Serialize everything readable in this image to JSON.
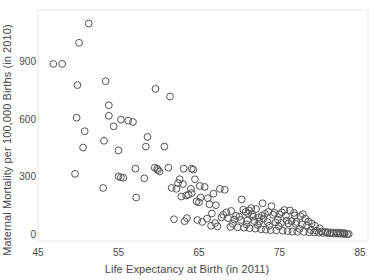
{
  "chart_data": {
    "type": "scatter",
    "title": "",
    "xlabel": "Life Expectancy at Birth (in 2011)",
    "ylabel": "Maternal Mortality per 100,000 Births (in 2010)",
    "xlim": [
      45,
      85
    ],
    "ylim": [
      -30,
      1120
    ],
    "xticks": [
      45,
      55,
      65,
      75,
      85
    ],
    "yticks": [
      0,
      300,
      600,
      900
    ],
    "xtick_labels": [
      "45",
      "55",
      "65",
      "75",
      "85"
    ],
    "ytick_labels": [
      "0",
      "300",
      "600",
      "900"
    ],
    "grid": false,
    "legend": null,
    "marker": {
      "shape": "circle-open",
      "edge_color": "#555555",
      "fill": "none",
      "radius_px": 3.4,
      "stroke_px": 1
    },
    "points": [
      {
        "x": 51.3,
        "y": 1100
      },
      {
        "x": 50.1,
        "y": 1000
      },
      {
        "x": 46.9,
        "y": 890
      },
      {
        "x": 48.0,
        "y": 890
      },
      {
        "x": 49.9,
        "y": 780
      },
      {
        "x": 53.4,
        "y": 800
      },
      {
        "x": 59.6,
        "y": 760
      },
      {
        "x": 61.4,
        "y": 720
      },
      {
        "x": 53.8,
        "y": 675
      },
      {
        "x": 49.8,
        "y": 610
      },
      {
        "x": 53.8,
        "y": 620
      },
      {
        "x": 55.3,
        "y": 600
      },
      {
        "x": 56.2,
        "y": 595
      },
      {
        "x": 56.8,
        "y": 588
      },
      {
        "x": 54.4,
        "y": 565
      },
      {
        "x": 50.8,
        "y": 540
      },
      {
        "x": 58.6,
        "y": 510
      },
      {
        "x": 53.2,
        "y": 490
      },
      {
        "x": 50.6,
        "y": 455
      },
      {
        "x": 58.4,
        "y": 460
      },
      {
        "x": 60.7,
        "y": 460
      },
      {
        "x": 55.0,
        "y": 440
      },
      {
        "x": 57.1,
        "y": 345
      },
      {
        "x": 59.5,
        "y": 350
      },
      {
        "x": 59.8,
        "y": 345
      },
      {
        "x": 59.9,
        "y": 338
      },
      {
        "x": 60.1,
        "y": 330
      },
      {
        "x": 61.2,
        "y": 350
      },
      {
        "x": 63.1,
        "y": 345
      },
      {
        "x": 64.1,
        "y": 345
      },
      {
        "x": 64.3,
        "y": 340
      },
      {
        "x": 49.6,
        "y": 318
      },
      {
        "x": 55.0,
        "y": 305
      },
      {
        "x": 55.3,
        "y": 300
      },
      {
        "x": 55.6,
        "y": 298
      },
      {
        "x": 58.2,
        "y": 295
      },
      {
        "x": 62.6,
        "y": 290
      },
      {
        "x": 64.5,
        "y": 290
      },
      {
        "x": 62.4,
        "y": 270
      },
      {
        "x": 63.0,
        "y": 265
      },
      {
        "x": 53.1,
        "y": 245
      },
      {
        "x": 61.6,
        "y": 245
      },
      {
        "x": 62.2,
        "y": 240
      },
      {
        "x": 64.0,
        "y": 240
      },
      {
        "x": 65.1,
        "y": 255
      },
      {
        "x": 65.7,
        "y": 250
      },
      {
        "x": 67.6,
        "y": 240
      },
      {
        "x": 68.2,
        "y": 235
      },
      {
        "x": 66.8,
        "y": 215
      },
      {
        "x": 64.1,
        "y": 218
      },
      {
        "x": 63.7,
        "y": 210
      },
      {
        "x": 63.4,
        "y": 205
      },
      {
        "x": 62.8,
        "y": 200
      },
      {
        "x": 65.2,
        "y": 195
      },
      {
        "x": 66.1,
        "y": 192
      },
      {
        "x": 64.7,
        "y": 175
      },
      {
        "x": 65.0,
        "y": 170
      },
      {
        "x": 70.3,
        "y": 185
      },
      {
        "x": 57.2,
        "y": 195
      },
      {
        "x": 66.3,
        "y": 160
      },
      {
        "x": 67.1,
        "y": 155
      },
      {
        "x": 72.9,
        "y": 165
      },
      {
        "x": 74.0,
        "y": 150
      },
      {
        "x": 71.5,
        "y": 140
      },
      {
        "x": 72.1,
        "y": 135
      },
      {
        "x": 75.6,
        "y": 130
      },
      {
        "x": 76.3,
        "y": 128
      },
      {
        "x": 69.0,
        "y": 125
      },
      {
        "x": 68.4,
        "y": 118
      },
      {
        "x": 70.8,
        "y": 120
      },
      {
        "x": 71.1,
        "y": 112
      },
      {
        "x": 71.6,
        "y": 108
      },
      {
        "x": 73.2,
        "y": 110
      },
      {
        "x": 74.2,
        "y": 105
      },
      {
        "x": 75.0,
        "y": 108
      },
      {
        "x": 75.8,
        "y": 100
      },
      {
        "x": 76.9,
        "y": 102
      },
      {
        "x": 77.6,
        "y": 98
      },
      {
        "x": 63.5,
        "y": 88
      },
      {
        "x": 66.0,
        "y": 85
      },
      {
        "x": 67.8,
        "y": 92
      },
      {
        "x": 68.6,
        "y": 88
      },
      {
        "x": 69.4,
        "y": 80
      },
      {
        "x": 70.2,
        "y": 78
      },
      {
        "x": 71.0,
        "y": 75
      },
      {
        "x": 71.9,
        "y": 72
      },
      {
        "x": 72.5,
        "y": 70
      },
      {
        "x": 73.5,
        "y": 68
      },
      {
        "x": 74.5,
        "y": 65
      },
      {
        "x": 75.2,
        "y": 62
      },
      {
        "x": 76.1,
        "y": 60
      },
      {
        "x": 77.0,
        "y": 58
      },
      {
        "x": 77.8,
        "y": 55
      },
      {
        "x": 78.4,
        "y": 50
      },
      {
        "x": 66.5,
        "y": 48
      },
      {
        "x": 67.3,
        "y": 45
      },
      {
        "x": 68.9,
        "y": 42
      },
      {
        "x": 69.8,
        "y": 40
      },
      {
        "x": 70.6,
        "y": 38
      },
      {
        "x": 71.3,
        "y": 35
      },
      {
        "x": 72.0,
        "y": 33
      },
      {
        "x": 72.7,
        "y": 30
      },
      {
        "x": 73.3,
        "y": 28
      },
      {
        "x": 73.9,
        "y": 25
      },
      {
        "x": 74.6,
        "y": 24
      },
      {
        "x": 75.4,
        "y": 22
      },
      {
        "x": 76.0,
        "y": 20
      },
      {
        "x": 76.6,
        "y": 18
      },
      {
        "x": 77.2,
        "y": 17
      },
      {
        "x": 78.0,
        "y": 16
      },
      {
        "x": 78.7,
        "y": 14
      },
      {
        "x": 79.3,
        "y": 13
      },
      {
        "x": 79.9,
        "y": 12
      },
      {
        "x": 80.4,
        "y": 11
      },
      {
        "x": 80.9,
        "y": 10
      },
      {
        "x": 81.3,
        "y": 9
      },
      {
        "x": 81.7,
        "y": 8
      },
      {
        "x": 82.0,
        "y": 8
      },
      {
        "x": 82.3,
        "y": 7
      },
      {
        "x": 82.6,
        "y": 7
      },
      {
        "x": 82.9,
        "y": 6
      },
      {
        "x": 83.1,
        "y": 6
      },
      {
        "x": 83.4,
        "y": 5
      },
      {
        "x": 83.6,
        "y": 5
      },
      {
        "x": 80.2,
        "y": 18
      },
      {
        "x": 80.7,
        "y": 16
      },
      {
        "x": 81.0,
        "y": 15
      },
      {
        "x": 81.5,
        "y": 14
      },
      {
        "x": 82.1,
        "y": 13
      },
      {
        "x": 82.5,
        "y": 12
      },
      {
        "x": 83.0,
        "y": 11
      },
      {
        "x": 79.6,
        "y": 22
      },
      {
        "x": 78.9,
        "y": 26
      },
      {
        "x": 77.5,
        "y": 32
      },
      {
        "x": 74.9,
        "y": 45
      },
      {
        "x": 73.7,
        "y": 48
      },
      {
        "x": 72.3,
        "y": 52
      },
      {
        "x": 70.9,
        "y": 55
      },
      {
        "x": 69.2,
        "y": 58
      },
      {
        "x": 67.0,
        "y": 62
      },
      {
        "x": 65.4,
        "y": 68
      },
      {
        "x": 64.8,
        "y": 78
      },
      {
        "x": 63.2,
        "y": 72
      },
      {
        "x": 61.9,
        "y": 82
      },
      {
        "x": 71.7,
        "y": 95
      },
      {
        "x": 72.4,
        "y": 90
      },
      {
        "x": 73.0,
        "y": 85
      },
      {
        "x": 74.8,
        "y": 80
      },
      {
        "x": 75.9,
        "y": 75
      },
      {
        "x": 76.5,
        "y": 72
      },
      {
        "x": 77.1,
        "y": 68
      },
      {
        "x": 69.6,
        "y": 100
      },
      {
        "x": 70.0,
        "y": 95
      },
      {
        "x": 68.0,
        "y": 105
      },
      {
        "x": 66.6,
        "y": 112
      },
      {
        "x": 73.6,
        "y": 120
      },
      {
        "x": 74.4,
        "y": 115
      },
      {
        "x": 75.3,
        "y": 118
      },
      {
        "x": 76.8,
        "y": 115
      },
      {
        "x": 77.9,
        "y": 108
      },
      {
        "x": 71.2,
        "y": 128
      },
      {
        "x": 70.5,
        "y": 132
      },
      {
        "x": 72.8,
        "y": 100
      },
      {
        "x": 78.2,
        "y": 85
      },
      {
        "x": 78.6,
        "y": 70
      },
      {
        "x": 79.0,
        "y": 60
      },
      {
        "x": 79.4,
        "y": 48
      },
      {
        "x": 80.0,
        "y": 35
      }
    ]
  }
}
